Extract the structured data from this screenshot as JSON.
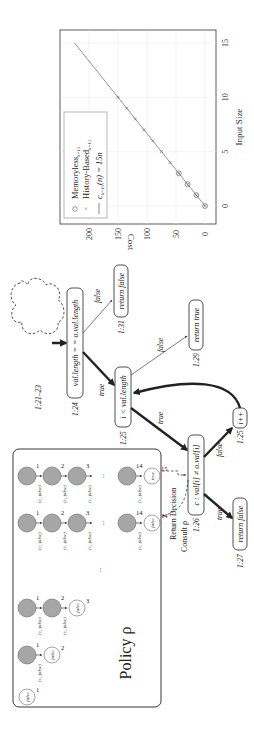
{
  "chart_data": {
    "type": "line",
    "orientation": "rotated-90-ccw",
    "title": "",
    "xlabel": "Input Size",
    "ylabel": "Cost",
    "xlim": [
      -1,
      16.5
    ],
    "ylim": [
      -10,
      240
    ],
    "x_ticks": [
      "0",
      "5",
      "10",
      "15"
    ],
    "y_ticks": [
      "0",
      "50",
      "100",
      "150",
      "200"
    ],
    "grid": true,
    "legend_position": "upper left",
    "legend": [
      "Memoryless_{k=15}",
      "History-Based_{k=15}",
      "c_{k=15}(n) = 15n"
    ],
    "series": [
      {
        "name": "Memoryless_{k=15}",
        "marker": "circle",
        "x": [
          0,
          1,
          2,
          3
        ],
        "y": [
          0,
          15,
          30,
          45
        ]
      },
      {
        "name": "History-Based_{k=15}",
        "marker": "x",
        "x": [
          0,
          1,
          2,
          3,
          4,
          5,
          6,
          7,
          8,
          9,
          10
        ],
        "y": [
          0,
          15,
          30,
          45,
          60,
          75,
          90,
          105,
          120,
          135,
          150
        ]
      },
      {
        "name": "c_{k=15}(n) = 15n",
        "marker": "line",
        "x": [
          0,
          15
        ],
        "y": [
          0,
          225
        ]
      }
    ]
  },
  "chart": {
    "xlabel": "Input Size",
    "ylabel": "Cost",
    "x_ticks": [
      "0",
      "5",
      "10",
      "15"
    ],
    "y_ticks": [
      "0",
      "50",
      "100",
      "150",
      "200"
    ],
    "legend": {
      "memoryless": {
        "main": "Memoryless",
        "sub": "k=15"
      },
      "history": {
        "main": "History-Based",
        "sub": "k=15"
      },
      "cost": {
        "pre": "c",
        "sub": "k=15",
        "post": "(n) = 15n"
      }
    }
  },
  "diagram": {
    "cloud_label": "1:21–23",
    "nodes": {
      "n124": {
        "line": "1:24",
        "text": "val.length = = o.val.length"
      },
      "n131": {
        "line": "1:31",
        "text": "return false"
      },
      "n125a": {
        "line": "1:25",
        "text": "i < val.length"
      },
      "n129": {
        "line": "1:29",
        "text": "return true"
      },
      "n126": {
        "line": "1:26",
        "text": "c : val[i] ≠ o.val[i]"
      },
      "n125b": {
        "line": "1:25",
        "text": "i++"
      },
      "n127": {
        "line": "1:27",
        "text": "return false"
      }
    },
    "edges": {
      "e1": "true",
      "e2": "false",
      "e3": "true",
      "e4": "false",
      "e5": "true",
      "e6": "false"
    },
    "consult": "Consult ρ",
    "return_decision": "Return Decision",
    "policy": {
      "title": "Policy ρ",
      "edge_label": "(c, false)",
      "false_label": "false",
      "true_label": "true",
      "ellipsis": "...",
      "chains": [
        {
          "gray": [],
          "end": {
            "value": "false",
            "index": "1"
          }
        },
        {
          "gray": [
            "1"
          ],
          "end": {
            "value": "false",
            "index": "2"
          }
        },
        {
          "gray": [
            "1",
            "2"
          ],
          "end": {
            "value": "false",
            "index": "3"
          }
        },
        {
          "gray": [
            "1",
            "2",
            "3",
            "14"
          ],
          "end": {
            "value": "false",
            "index": "14"
          }
        },
        {
          "gray": [
            "1",
            "2",
            "3",
            "14"
          ],
          "end": {
            "value": "true",
            "index": "15"
          }
        }
      ]
    }
  },
  "colors": {
    "gray_node": "#a6a6a6",
    "line": "#222222",
    "grid": "#e6e6e6",
    "plot_line": "#666666"
  }
}
